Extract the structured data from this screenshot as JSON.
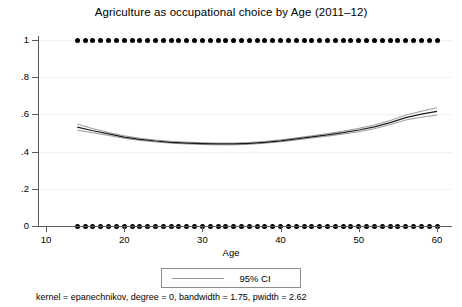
{
  "chart_data": {
    "type": "line",
    "title": "Agriculture as occupational choice by Age (2011–12)",
    "subtitle": "",
    "xlabel": "Age",
    "ylabel": "",
    "xlim": [
      10,
      60
    ],
    "ylim": [
      0,
      1
    ],
    "grid": true,
    "legend_position": "bottom-center",
    "xticks": [
      10,
      20,
      30,
      40,
      50,
      60
    ],
    "xtick_labels": [
      "10",
      "20",
      "30",
      "40",
      "50",
      "60"
    ],
    "yticks": [
      0,
      0.2,
      0.4,
      0.6,
      0.8,
      1
    ],
    "ytick_labels": [
      "0",
      ".2",
      ".4",
      ".6",
      ".8",
      "1"
    ],
    "annotations": [
      "kernel = epanechnikov, degree = 0, bandwidth = 1.75, pwidth = 2.62"
    ],
    "series": [
      {
        "name": "Local polynomial smooth",
        "type": "line",
        "color": "#1a1a1a",
        "x": [
          14,
          16,
          18,
          20,
          22,
          24,
          26,
          28,
          30,
          32,
          34,
          36,
          38,
          40,
          42,
          44,
          46,
          48,
          50,
          52,
          54,
          56,
          58,
          60
        ],
        "values": [
          0.532,
          0.512,
          0.495,
          0.478,
          0.466,
          0.457,
          0.45,
          0.446,
          0.443,
          0.441,
          0.441,
          0.444,
          0.45,
          0.458,
          0.468,
          0.479,
          0.49,
          0.502,
          0.516,
          0.533,
          0.556,
          0.583,
          0.601,
          0.616
        ]
      },
      {
        "name": "95% CI upper",
        "type": "line",
        "color": "#9a9a9a",
        "x": [
          14,
          16,
          18,
          20,
          22,
          24,
          26,
          28,
          30,
          32,
          34,
          36,
          38,
          40,
          42,
          44,
          46,
          48,
          50,
          52,
          54,
          56,
          58,
          60
        ],
        "values": [
          0.548,
          0.523,
          0.503,
          0.485,
          0.472,
          0.462,
          0.455,
          0.451,
          0.448,
          0.446,
          0.446,
          0.449,
          0.455,
          0.463,
          0.474,
          0.485,
          0.497,
          0.51,
          0.525,
          0.543,
          0.567,
          0.596,
          0.617,
          0.636
        ]
      },
      {
        "name": "95% CI lower",
        "type": "line",
        "color": "#9a9a9a",
        "x": [
          14,
          16,
          18,
          20,
          22,
          24,
          26,
          28,
          30,
          32,
          34,
          36,
          38,
          40,
          42,
          44,
          46,
          48,
          50,
          52,
          54,
          56,
          58,
          60
        ],
        "values": [
          0.516,
          0.501,
          0.487,
          0.471,
          0.46,
          0.452,
          0.445,
          0.441,
          0.438,
          0.436,
          0.436,
          0.439,
          0.445,
          0.453,
          0.462,
          0.473,
          0.483,
          0.494,
          0.507,
          0.523,
          0.545,
          0.57,
          0.585,
          0.596
        ]
      },
      {
        "name": "Observations (choice = 1)",
        "type": "scatter",
        "color": "#000000",
        "y_value": 1,
        "x": [
          14,
          15,
          16,
          17,
          18,
          19,
          20,
          21,
          22,
          23,
          24,
          25,
          26,
          27,
          28,
          29,
          30,
          31,
          32,
          33,
          34,
          35,
          36,
          37,
          38,
          39,
          40,
          41,
          42,
          43,
          44,
          45,
          46,
          47,
          48,
          49,
          50,
          51,
          52,
          53,
          54,
          55,
          56,
          57,
          58,
          59,
          60
        ]
      },
      {
        "name": "Observations (choice = 0)",
        "type": "scatter",
        "color": "#000000",
        "y_value": 0,
        "x": [
          14,
          15,
          16,
          17,
          18,
          19,
          20,
          21,
          22,
          23,
          24,
          25,
          26,
          27,
          28,
          29,
          30,
          31,
          32,
          33,
          34,
          35,
          36,
          37,
          38,
          39,
          40,
          41,
          42,
          43,
          44,
          45,
          46,
          47,
          48,
          49,
          50,
          51,
          52,
          53,
          54,
          55,
          56,
          57,
          58,
          59,
          60
        ]
      }
    ]
  },
  "legend": {
    "entries": [
      {
        "label": "95% CI",
        "color": "#9a9a9a"
      }
    ]
  },
  "footnote": "kernel = epanechnikov, degree = 0, bandwidth = 1.75, pwidth = 2.62",
  "colors": {
    "line": "#1a1a1a",
    "ci": "#9a9a9a",
    "dots": "#000000",
    "axis": "#5a5a5a",
    "grid": "#f2f2f4",
    "background": "#ffffff"
  }
}
